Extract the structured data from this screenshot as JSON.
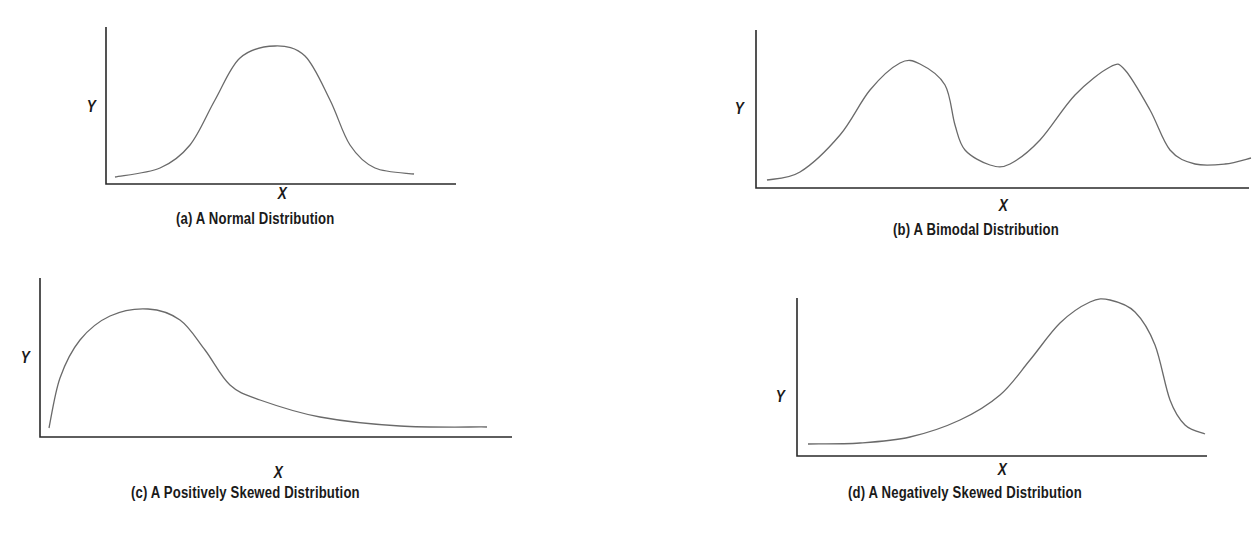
{
  "figure": {
    "axis_color": "#2a2a2a",
    "curve_color": "#6a6a6a",
    "background": "#ffffff"
  },
  "chart_data": [
    {
      "type": "line",
      "id": "a",
      "title": "(a) A Normal Distribution",
      "xlabel": "X",
      "ylabel": "Y",
      "grid": false,
      "ticks": false,
      "description": "Symmetric bell-shaped curve, single peak at center",
      "axes_px": {
        "origin": [
          106,
          184
        ],
        "y_top": 27,
        "x_end": 456
      },
      "y_label_px": [
        86,
        99
      ],
      "x_label_px": [
        282,
        186
      ],
      "caption_px": [
        176,
        211
      ],
      "points_px": [
        [
          115,
          177
        ],
        [
          160,
          168
        ],
        [
          190,
          145
        ],
        [
          215,
          100
        ],
        [
          240,
          58
        ],
        [
          275,
          46
        ],
        [
          305,
          56
        ],
        [
          330,
          100
        ],
        [
          350,
          145
        ],
        [
          375,
          168
        ],
        [
          414,
          174
        ]
      ]
    },
    {
      "type": "line",
      "id": "b",
      "title": "(b) A Bimodal Distribution",
      "xlabel": "X",
      "ylabel": "Y",
      "grid": false,
      "ticks": false,
      "description": "Curve with two peaks of similar height separated by a valley",
      "axes_px": {
        "origin": [
          756,
          188
        ],
        "y_top": 30,
        "x_end": 1249
      },
      "y_label_px": [
        734,
        101
      ],
      "x_label_px": [
        1003,
        198
      ],
      "caption_px": [
        893,
        222
      ],
      "points_px": [
        [
          767,
          180
        ],
        [
          800,
          172
        ],
        [
          840,
          135
        ],
        [
          870,
          90
        ],
        [
          900,
          63
        ],
        [
          920,
          64
        ],
        [
          945,
          85
        ],
        [
          955,
          125
        ],
        [
          965,
          150
        ],
        [
          990,
          165
        ],
        [
          1010,
          164
        ],
        [
          1040,
          140
        ],
        [
          1075,
          95
        ],
        [
          1110,
          67
        ],
        [
          1125,
          70
        ],
        [
          1150,
          110
        ],
        [
          1170,
          150
        ],
        [
          1195,
          164
        ],
        [
          1225,
          164
        ],
        [
          1251,
          158
        ]
      ]
    },
    {
      "type": "line",
      "id": "c",
      "title": "(c) A Positively Skewed Distribution",
      "xlabel": "X",
      "ylabel": "Y",
      "grid": false,
      "ticks": false,
      "description": "Peak toward left with long tail extending to the right",
      "axes_px": {
        "origin": [
          40,
          437
        ],
        "y_top": 278,
        "x_end": 512
      },
      "y_label_px": [
        20,
        350
      ],
      "x_label_px": [
        278,
        465
      ],
      "caption_px": [
        131,
        485
      ],
      "points_px": [
        [
          49,
          428
        ],
        [
          60,
          378
        ],
        [
          80,
          340
        ],
        [
          110,
          316
        ],
        [
          148,
          309
        ],
        [
          180,
          320
        ],
        [
          205,
          350
        ],
        [
          230,
          385
        ],
        [
          260,
          400
        ],
        [
          320,
          417
        ],
        [
          400,
          426
        ],
        [
          487,
          427
        ]
      ]
    },
    {
      "type": "line",
      "id": "d",
      "title": "(d) A Negatively Skewed Distribution",
      "xlabel": "X",
      "ylabel": "Y",
      "grid": false,
      "ticks": false,
      "description": "Peak toward right with long tail extending to the left",
      "axes_px": {
        "origin": [
          797,
          456
        ],
        "y_top": 298,
        "x_end": 1207
      },
      "y_label_px": [
        775,
        389
      ],
      "x_label_px": [
        1002,
        462
      ],
      "caption_px": [
        848,
        485
      ],
      "points_px": [
        [
          808,
          444
        ],
        [
          860,
          443
        ],
        [
          910,
          437
        ],
        [
          960,
          420
        ],
        [
          1000,
          395
        ],
        [
          1030,
          360
        ],
        [
          1060,
          323
        ],
        [
          1090,
          302
        ],
        [
          1110,
          300
        ],
        [
          1135,
          312
        ],
        [
          1155,
          345
        ],
        [
          1170,
          400
        ],
        [
          1185,
          425
        ],
        [
          1205,
          434
        ]
      ]
    }
  ]
}
